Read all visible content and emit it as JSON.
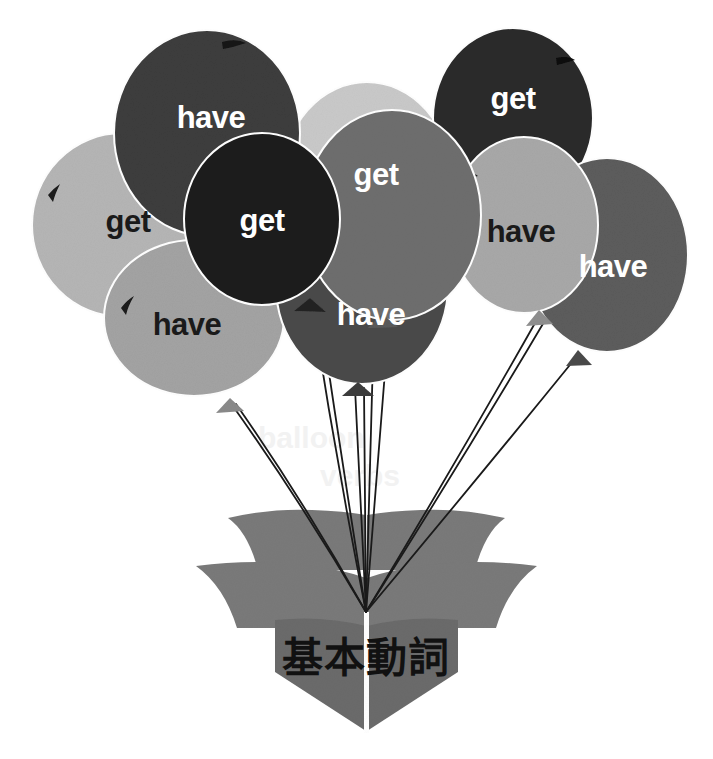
{
  "image": {
    "title": "Basic Verbs balloon illustration",
    "background_color": "#ffffff",
    "width": 713,
    "height": 759
  },
  "book": {
    "label": "基本動詞",
    "label_romaji_meaning": "basic verbs",
    "page_color": "#7a7a7a",
    "page_color_dark": "#6b6b6b",
    "label_color": "#111111"
  },
  "balloons": [
    {
      "id": "balloon-have-topleft",
      "label": "have",
      "fill": "#3d3d3d",
      "text_color": "#ffffff",
      "cx": 207,
      "cy": 133,
      "rx": 93,
      "ry": 103,
      "label_x": 211,
      "label_y": 128,
      "knot_x": 217,
      "knot_y": 236,
      "highlight": "dark",
      "highlight_x": 232,
      "highlight_y": 44
    },
    {
      "id": "balloon-get-left",
      "label": "get",
      "fill": "#b5b5b5",
      "text_color": "#1a1a1a",
      "cx": 122,
      "cy": 225,
      "rx": 90,
      "ry": 92,
      "label_x": 128,
      "label_y": 221,
      "knot_x": 128,
      "knot_y": 316,
      "highlight": "dark",
      "highlight_x": 51,
      "highlight_y": 190
    },
    {
      "id": "balloon-have-lowerleft",
      "label": "have",
      "fill": "#a3a3a3",
      "text_color": "#1a1a1a",
      "cx": 194,
      "cy": 318,
      "rx": 90,
      "ry": 78,
      "label_x": 182,
      "label_y": 327,
      "knot_x": 230,
      "knot_y": 400,
      "highlight": "dark",
      "highlight_x": 124,
      "highlight_y": 303
    },
    {
      "id": "balloon-light-behind-center",
      "label": "",
      "fill": "#c9c9c9",
      "text_color": "#1a1a1a",
      "cx": 367,
      "cy": 178,
      "rx": 84,
      "ry": 96,
      "label_x": 0,
      "label_y": 0,
      "knot_x": 0,
      "knot_y": 0,
      "highlight": "none",
      "highlight_x": 0,
      "highlight_y": 0
    },
    {
      "id": "balloon-get-dark",
      "label": "get",
      "fill": "#1e1e1e",
      "text_color": "#ffffff",
      "cx": 262,
      "cy": 219,
      "rx": 78,
      "ry": 86,
      "label_x": 262,
      "label_y": 216,
      "knot_x": 310,
      "knot_y": 302,
      "highlight": "none",
      "highlight_x": 0,
      "highlight_y": 0
    },
    {
      "id": "balloon-get-center",
      "label": "get",
      "fill": "#6e6e6e",
      "text_color": "#ffffff",
      "cx": 392,
      "cy": 215,
      "rx": 89,
      "ry": 105,
      "label_x": 376,
      "label_y": 175,
      "knot_x": 384,
      "knot_y": 318,
      "highlight": "none",
      "highlight_x": 0,
      "highlight_y": 0
    },
    {
      "id": "balloon-have-center",
      "label": "have",
      "fill": "#4a4a4a",
      "text_color": "#ffffff",
      "cx": 362,
      "cy": 286,
      "rx": 86,
      "ry": 98,
      "label_x": 371,
      "label_y": 313,
      "knot_x": 358,
      "knot_y": 385,
      "highlight": "none",
      "highlight_x": 0,
      "highlight_y": 0
    },
    {
      "id": "balloon-get-topright",
      "label": "get",
      "fill": "#2b2b2b",
      "text_color": "#ffffff",
      "cx": 513,
      "cy": 118,
      "rx": 80,
      "ry": 90,
      "label_x": 506,
      "label_y": 109,
      "knot_x": 522,
      "knot_y": 208,
      "highlight": "dark",
      "highlight_x": 562,
      "highlight_y": 62
    },
    {
      "id": "balloon-have-right",
      "label": "have",
      "fill": "#a8a8a8",
      "text_color": "#1a1a1a",
      "cx": 524,
      "cy": 225,
      "rx": 74,
      "ry": 88,
      "label_x": 518,
      "label_y": 229,
      "knot_x": 539,
      "knot_y": 313,
      "highlight": "dark",
      "highlight_x": 467,
      "highlight_y": 179
    },
    {
      "id": "balloon-have-farright",
      "label": "have",
      "fill": "#5c5c5c",
      "text_color": "#ffffff",
      "cx": 607,
      "cy": 255,
      "rx": 81,
      "ry": 97,
      "label_x": 613,
      "label_y": 268,
      "knot_x": 578,
      "knot_y": 352,
      "highlight": "none",
      "highlight_x": 0,
      "highlight_y": 0
    }
  ],
  "strings": {
    "color": "#1a1a1a",
    "converge_x": 366,
    "converge_y": 612
  },
  "ghost_text": [
    {
      "text": "balloon",
      "x": 258,
      "y": 448
    },
    {
      "text": "verbs",
      "x": 320,
      "y": 486
    }
  ]
}
